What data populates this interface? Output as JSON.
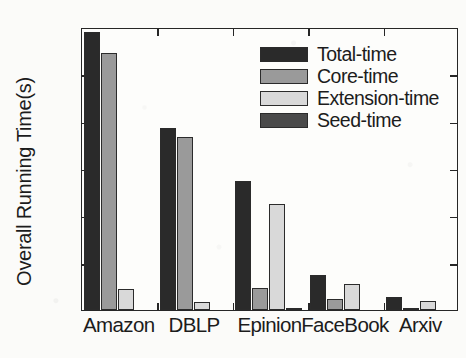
{
  "chart_data": {
    "type": "bar",
    "title": "",
    "xlabel": "",
    "ylabel": "Overall Running Time(s)",
    "ylim": [
      0,
      1200
    ],
    "yticks": [
      0,
      200,
      400,
      600,
      800,
      1000,
      1200
    ],
    "ytick_labels": [
      "0",
      "200",
      "400",
      "600",
      "800",
      "1000",
      "1200"
    ],
    "grid": false,
    "legend_position": "upper center-right",
    "categories": [
      "Amazon",
      "DBLP",
      "Epinion",
      "FaceBook",
      "Arxiv"
    ],
    "series": [
      {
        "name": "Total-time",
        "color": "#2a2a2a",
        "values": [
          1180,
          770,
          545,
          150,
          55
        ]
      },
      {
        "name": "Core-time",
        "color": "#9a9a9a",
        "values": [
          1090,
          735,
          95,
          45,
          10
        ]
      },
      {
        "name": "Extension-time",
        "color": "#d9d9d9",
        "values": [
          90,
          35,
          450,
          110,
          40
        ]
      },
      {
        "name": "Seed-time",
        "color": "#4a4a4a",
        "values": [
          0,
          0,
          5,
          0,
          0
        ]
      }
    ]
  },
  "legend": {
    "items": [
      {
        "label": "Total-time",
        "color": "#2a2a2a"
      },
      {
        "label": "Core-time",
        "color": "#9a9a9a"
      },
      {
        "label": "Extension-time",
        "color": "#d9d9d9"
      },
      {
        "label": "Seed-time",
        "color": "#4a4a4a"
      }
    ]
  },
  "axes": {
    "y_title": "Overall Running Time(s)"
  }
}
